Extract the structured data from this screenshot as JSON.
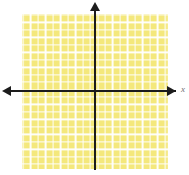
{
  "figure": {
    "name": "coordinate-plane-graph",
    "width": 189,
    "height": 175,
    "background_color": "#ffffff"
  },
  "grid": {
    "fill_color": "#f4e87c",
    "gridline_color": "#ffffff",
    "cell_size_px": 7.45,
    "left_px": 22,
    "top_px": 14,
    "width_px": 146,
    "height_px": 155,
    "columns": 20,
    "rows": 21
  },
  "axes": {
    "color": "#1c1c1c",
    "x_axis": {
      "label": "x",
      "label_color": "#6f6f6f",
      "arrow_left": true,
      "arrow_right": true,
      "y_position_px": 91
    },
    "y_axis": {
      "label": "",
      "arrow_up": true,
      "arrow_down": false,
      "x_position_px": 95
    },
    "origin": {
      "x_px": 95,
      "y_px": 91
    }
  },
  "chart_data": {
    "type": "scatter",
    "title": "",
    "subtitle": "",
    "xlabel": "x",
    "ylabel": "",
    "grid": true,
    "legend": null,
    "legend_position": "none",
    "xlim": [
      -10,
      10
    ],
    "ylim": [
      -11,
      10
    ],
    "xticks": [],
    "yticks": [],
    "xticklabels": [],
    "yticklabels": [],
    "series": [],
    "annotations": []
  }
}
